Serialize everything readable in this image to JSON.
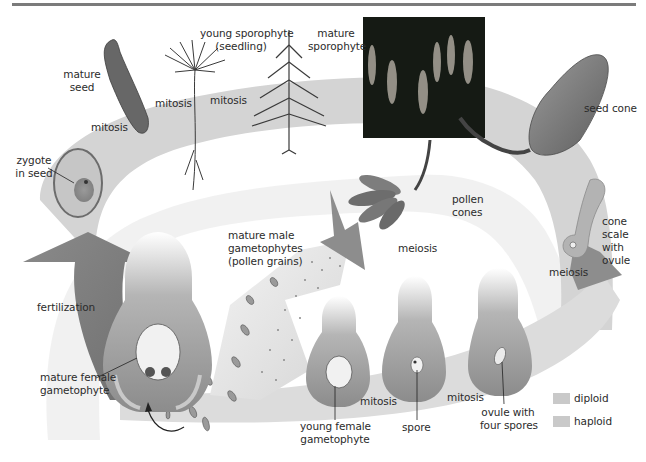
{
  "diagram": {
    "colors": {
      "top_rule": "#7b7b7b",
      "diploid_band": "#d6d6d6",
      "haploid_band": "#cfcfcf",
      "ovule_tissue": "#8f8f8f",
      "dark_arrow": "#7a7a7a",
      "photo_bg": "#151a14",
      "legend_swatch": "#c9c9c9"
    },
    "labels": {
      "mature_seed": [
        "mature",
        "seed"
      ],
      "young_sporophyte": [
        "young sporophyte",
        "(seedling)"
      ],
      "mature_sporophyte": [
        "mature",
        "sporophyte"
      ],
      "seed_cone": "seed cone",
      "pollen_cones": [
        "pollen",
        "cones"
      ],
      "cone_scale": [
        "cone",
        "scale",
        "with",
        "ovule"
      ],
      "meiosis_left": "meiosis",
      "meiosis_right": "meiosis",
      "mitosis_1": "mitosis",
      "mitosis_2": "mitosis",
      "mitosis_3": "mitosis",
      "mitosis_4": "mitosis",
      "mitosis_5": "mitosis",
      "zygote": [
        "zygote",
        "in seed"
      ],
      "fertilization": "fertilization",
      "male_gametophytes": [
        "mature male",
        "gametophytes",
        "(pollen grains)"
      ],
      "mature_female": [
        "mature female",
        "gametophyte"
      ],
      "young_female": [
        "young female",
        "gametophyte"
      ],
      "spore": "spore",
      "ovule_four_spores": [
        "ovule with",
        "four spores"
      ]
    },
    "legend": [
      {
        "label": "diploid",
        "color": "#c9c9c9"
      },
      {
        "label": "haploid",
        "color": "#cdcdcd"
      }
    ]
  }
}
